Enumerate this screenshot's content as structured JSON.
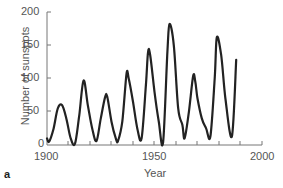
{
  "chart_data": {
    "type": "line",
    "title": "",
    "panel_label": "a",
    "xlabel": "Year",
    "ylabel": "Number of sunspots",
    "xlim": [
      1900,
      2000
    ],
    "ylim": [
      0,
      200
    ],
    "x_ticks": [
      1900,
      1950,
      2000
    ],
    "y_ticks": [
      0,
      50,
      100,
      150,
      200
    ],
    "grid": false,
    "series": [
      {
        "name": "Sunspots",
        "x": [
          1900,
          1901,
          1903,
          1905,
          1907,
          1909,
          1911,
          1913,
          1915,
          1917,
          1919,
          1921,
          1923,
          1925,
          1927,
          1928,
          1930,
          1932,
          1933,
          1935,
          1937,
          1938,
          1940,
          1942,
          1944,
          1946,
          1947,
          1948,
          1950,
          1952,
          1954,
          1956,
          1957,
          1959,
          1961,
          1963,
          1964,
          1966,
          1968,
          1969,
          1970,
          1972,
          1974,
          1976,
          1978,
          1979,
          1981,
          1983,
          1986,
          1988
        ],
        "values": [
          10,
          5,
          24,
          55,
          60,
          40,
          10,
          2,
          45,
          97,
          60,
          25,
          6,
          40,
          72,
          73,
          35,
          10,
          6,
          35,
          107,
          100,
          65,
          25,
          10,
          90,
          140,
          135,
          80,
          35,
          4,
          140,
          182,
          150,
          55,
          30,
          10,
          50,
          104,
          95,
          70,
          40,
          25,
          13,
          100,
          162,
          135,
          70,
          13,
          128
        ]
      }
    ]
  }
}
